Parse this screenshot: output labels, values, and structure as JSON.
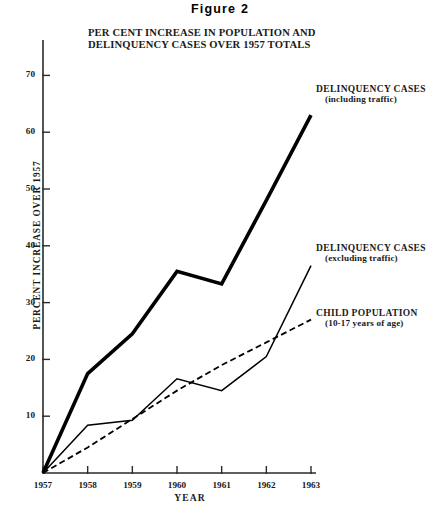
{
  "figure": {
    "title": "Figure  2",
    "subtitle_line1": "PER CENT INCREASE IN POPULATION AND",
    "subtitle_line2": "DELINQUENCY CASES OVER 1957 TOTALS"
  },
  "axes": {
    "ylabel": "PERCENT INCREASE OVER 1957",
    "xlabel": "YEAR",
    "yticks": [
      10,
      20,
      30,
      40,
      50,
      60,
      70
    ],
    "ytick_labels": [
      "10",
      "20",
      "30",
      "40",
      "50",
      "60",
      "70"
    ],
    "xtick_labels": [
      "1957",
      "1958",
      "1959",
      "1960",
      "1961",
      "1962",
      "1963"
    ]
  },
  "annotations": [
    {
      "name": "delinquency-including-traffic",
      "main": "DELINQUENCY CASES",
      "sub": "(including traffic)"
    },
    {
      "name": "delinquency-excluding-traffic",
      "main": "DELINQUENCY CASES",
      "sub": "(excluding traffic)"
    },
    {
      "name": "child-population",
      "main": "CHILD POPULATION",
      "sub": "(10-17 years of age)"
    }
  ],
  "chart_data": {
    "type": "line",
    "title": "PER CENT INCREASE IN POPULATION AND DELINQUENCY CASES OVER 1957 TOTALS",
    "xlabel": "YEAR",
    "ylabel": "PERCENT INCREASE OVER 1957",
    "categories": [
      "1957",
      "1958",
      "1959",
      "1960",
      "1961",
      "1962",
      "1963"
    ],
    "x": [
      1957,
      1958,
      1959,
      1960,
      1961,
      1962,
      1963
    ],
    "xlim": [
      1957,
      1963
    ],
    "ylim": [
      0,
      72
    ],
    "grid": false,
    "legend_position": "right-inline-annotations",
    "series": [
      {
        "name": "DELINQUENCY CASES (including traffic)",
        "style": "solid-thick",
        "color": "#000000",
        "values": [
          0,
          17.5,
          24.5,
          35.5,
          33.3,
          48.0,
          63.0
        ]
      },
      {
        "name": "DELINQUENCY CASES (excluding traffic)",
        "style": "solid-thin",
        "color": "#000000",
        "values": [
          0,
          8.4,
          9.3,
          16.6,
          14.5,
          20.5,
          36.5
        ]
      },
      {
        "name": "CHILD POPULATION (10-17 years of age)",
        "style": "dashed",
        "color": "#000000",
        "values": [
          0,
          4.5,
          9.5,
          14.5,
          19.0,
          23.0,
          27.0
        ]
      }
    ]
  }
}
